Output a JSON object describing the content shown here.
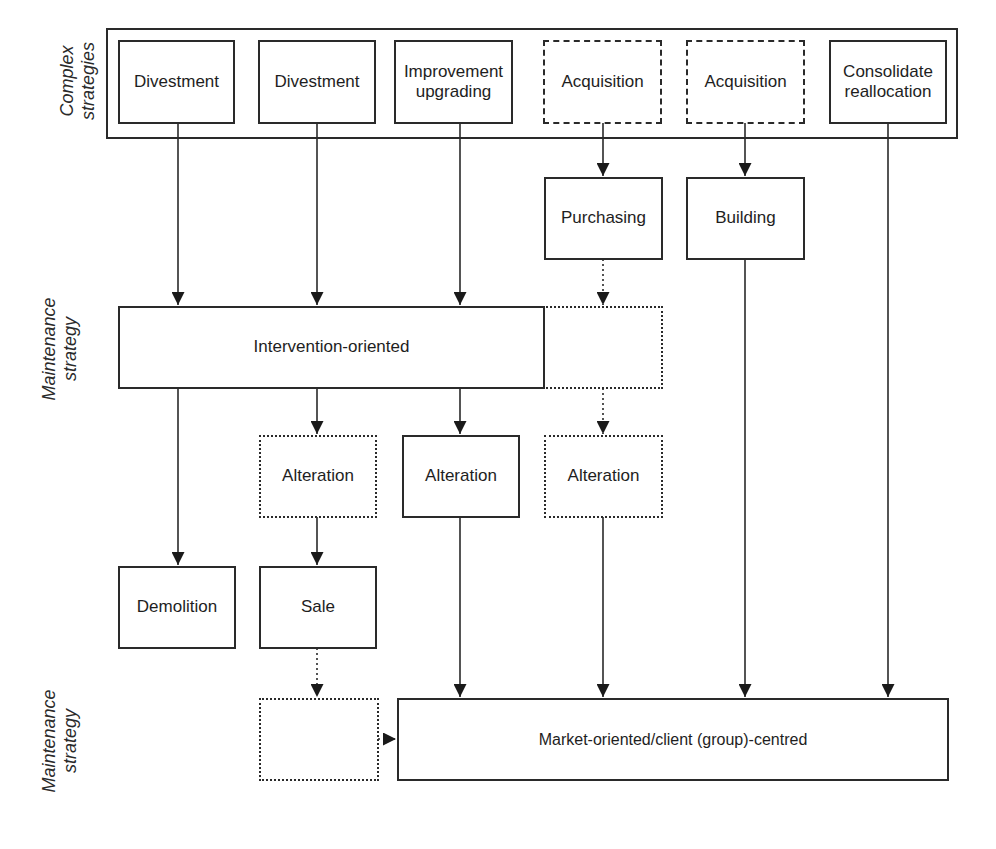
{
  "rows": {
    "complex_label": "Complex\nstrategies",
    "maintenance_label_1": "Maintenance\nstrategy",
    "maintenance_label_2": "Maintenance\nstrategy"
  },
  "complex_strategies": [
    {
      "label": "Divestment",
      "style": "solid"
    },
    {
      "label": "Divestment",
      "style": "solid"
    },
    {
      "label": "Improvement\nupgrading",
      "style": "solid"
    },
    {
      "label": "Acquisition",
      "style": "dashed"
    },
    {
      "label": "Acquisition",
      "style": "dashed"
    },
    {
      "label": "Consolidate\nreallocation",
      "style": "solid"
    }
  ],
  "acquisition_methods": [
    {
      "label": "Purchasing",
      "style": "solid"
    },
    {
      "label": "Building",
      "style": "solid"
    }
  ],
  "maintenance_1": {
    "label": "Intervention-oriented",
    "extension_style": "dotted"
  },
  "alterations": [
    {
      "label": "Alteration",
      "style": "dotted"
    },
    {
      "label": "Alteration",
      "style": "solid"
    },
    {
      "label": "Alteration",
      "style": "dotted"
    }
  ],
  "outcomes": [
    {
      "label": "Demolition",
      "style": "solid"
    },
    {
      "label": "Sale",
      "style": "solid"
    }
  ],
  "maintenance_2": {
    "label": "Market-oriented/client (group)-centred",
    "placeholder_style": "dotted"
  },
  "colors": {
    "line": "#2a2a2a",
    "background": "#ffffff",
    "text": "#1e1e1e"
  }
}
